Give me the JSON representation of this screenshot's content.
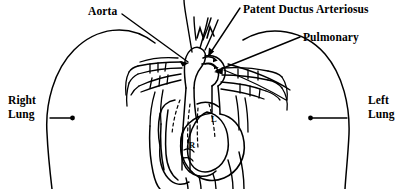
{
  "figure": {
    "background_color": "#ffffff",
    "ink_color": "#000000",
    "width": 420,
    "height": 189
  },
  "labels": {
    "aorta": "Aorta",
    "patent_ductus_arteriosus": "Patent Ductus Arteriosus",
    "pulmonary": "Pulmonary",
    "right_lung": "Right\nLung",
    "left_lung": "Left\nLung"
  },
  "chamber_labels": {
    "left_ventricle": "L",
    "right_ventricle": "R"
  },
  "icons": {
    "aorta_leader": "leader-line-arrow-icon",
    "pda_leader": "leader-line-arrow-icon",
    "pulmonary_leader": "leader-line-arrow-icon",
    "right_lung_leader": "leader-line-dot-icon",
    "left_lung_leader": "leader-line-dot-icon"
  }
}
